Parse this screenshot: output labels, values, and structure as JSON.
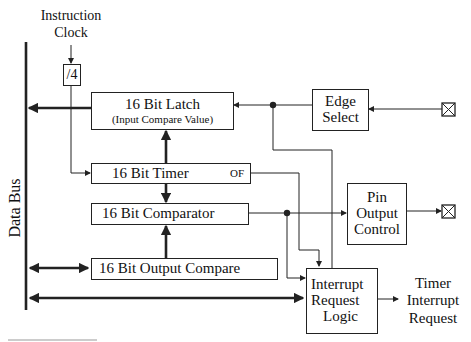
{
  "diagram": {
    "title_label": {
      "line1": "Instruction",
      "line2": "Clock"
    },
    "divider": "/4",
    "data_bus_label": "Data Bus",
    "blocks": {
      "latch": {
        "title": "16 Bit Latch",
        "subtitle": "(Input Compare Value)"
      },
      "timer": {
        "title": "16 Bit Timer",
        "flag": "OF"
      },
      "comparator": {
        "title": "16 Bit Comparator"
      },
      "output_compare": {
        "title": "16 Bit Output Compare"
      },
      "edge_select": {
        "line1": "Edge",
        "line2": "Select"
      },
      "pin_output_control": {
        "line1": "Pin",
        "line2": "Output",
        "line3": "Control"
      },
      "interrupt_logic": {
        "line1": "Interrupt",
        "line2": "Request",
        "line3": "Logic"
      }
    },
    "output_label": {
      "line1": "Timer",
      "line2": "Interrupt",
      "line3": "Request"
    },
    "pins": [
      "input-pin",
      "output-pin"
    ],
    "colors": {
      "line": "#222222",
      "background": "#ffffff"
    }
  }
}
